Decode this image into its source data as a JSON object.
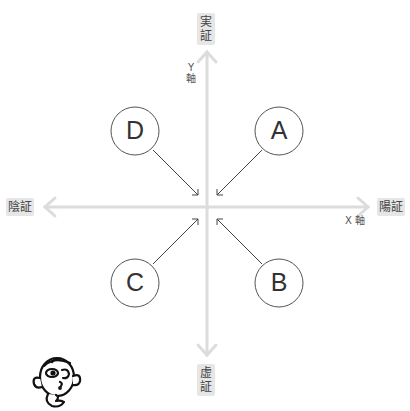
{
  "axes": {
    "top_label": "実証",
    "bottom_label": "虚証",
    "left_label": "陰証",
    "right_label": "陽証",
    "y_axis_name_line1": "Y",
    "y_axis_name_line2": "軸",
    "x_axis_name": "X 軸",
    "axis_color": "#dcdcdc",
    "label_bg": "#e6e6e6"
  },
  "nodes": [
    {
      "id": "A",
      "label": "A",
      "quadrant": "upper-right"
    },
    {
      "id": "B",
      "label": "B",
      "quadrant": "lower-right"
    },
    {
      "id": "C",
      "label": "C",
      "quadrant": "lower-left"
    },
    {
      "id": "D",
      "label": "D",
      "quadrant": "upper-left"
    }
  ],
  "illustration": "thinking-face-icon"
}
